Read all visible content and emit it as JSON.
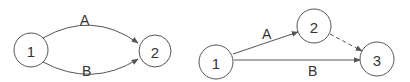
{
  "diagrams": [
    {
      "name": "parallel-edges-graph",
      "nodes": [
        {
          "id": "1",
          "label": "1"
        },
        {
          "id": "2",
          "label": "2"
        }
      ],
      "edges": [
        {
          "from": "1",
          "to": "2",
          "label": "A",
          "style": "solid"
        },
        {
          "from": "1",
          "to": "2",
          "label": "B",
          "style": "solid"
        }
      ]
    },
    {
      "name": "dummy-edge-graph",
      "nodes": [
        {
          "id": "1",
          "label": "1"
        },
        {
          "id": "2",
          "label": "2"
        },
        {
          "id": "3",
          "label": "3"
        }
      ],
      "edges": [
        {
          "from": "1",
          "to": "2",
          "label": "A",
          "style": "solid"
        },
        {
          "from": "1",
          "to": "3",
          "label": "B",
          "style": "solid"
        },
        {
          "from": "2",
          "to": "3",
          "label": "",
          "style": "dashed"
        }
      ]
    }
  ],
  "colors": {
    "stroke": "#555555",
    "text": "#333333",
    "background": "#ffffff"
  }
}
